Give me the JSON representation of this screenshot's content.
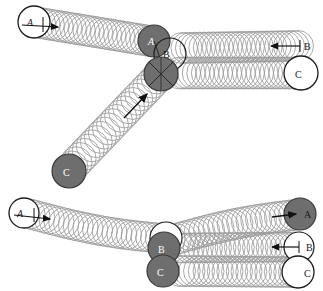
{
  "figure": {
    "type": "strobe-collision-diagram",
    "title": "",
    "panels": [
      {
        "id": "top",
        "name": "panel-top",
        "balls": [
          {
            "label": "A",
            "role": "incoming-cue-ball",
            "state": "start",
            "fill": "white",
            "label_style": "italic",
            "cx": 34,
            "cy": 22,
            "r": 16,
            "arrow": {
              "from": [
                34,
                25
              ],
              "to": [
                60,
                28
              ],
              "direction": "right-down"
            }
          },
          {
            "label": "A",
            "role": "cue-ball",
            "state": "at-impact",
            "fill": "gray",
            "label_style": "italic",
            "cx": 154,
            "cy": 41,
            "r": 16
          },
          {
            "label": "B",
            "role": "target-ball",
            "state": "at-impact",
            "fill": "white",
            "label_style": "upright",
            "cx": 167,
            "cy": 53,
            "r": 16
          },
          {
            "label": "C",
            "role": "third-ball",
            "state": "at-impact",
            "fill": "gray",
            "label_style": "upright",
            "cx": 161,
            "cy": 74,
            "r": 17,
            "crosshair": true
          },
          {
            "label": "C",
            "role": "third-ball",
            "state": "start",
            "fill": "gray",
            "label_style": "upright",
            "cx": 69,
            "cy": 171,
            "r": 17,
            "arrow": {
              "from": [
                122,
                120
              ],
              "to": [
                148,
                93
              ],
              "direction": "up-right"
            }
          },
          {
            "label": "B",
            "role": "target-ball",
            "state": "end",
            "fill": "white",
            "label_style": "upright",
            "cx": 306,
            "cy": 45,
            "r": 16,
            "arrow": {
              "from": [
                300,
                46
              ],
              "to": [
                272,
                46
              ],
              "direction": "left"
            }
          },
          {
            "label": "C",
            "role": "third-ball",
            "state": "end",
            "fill": "white",
            "label_style": "upright",
            "cx": 302,
            "cy": 73,
            "r": 17
          }
        ],
        "trails": [
          {
            "name": "trail-A-incoming",
            "from": [
              34,
              22
            ],
            "to": [
              154,
              41
            ]
          },
          {
            "name": "trail-C-incoming",
            "from": [
              69,
              171
            ],
            "to": [
              161,
              74
            ]
          },
          {
            "name": "trail-B-outgoing",
            "from": [
              180,
              47
            ],
            "to": [
              306,
              45
            ]
          },
          {
            "name": "trail-C-outgoing",
            "from": [
              178,
              73
            ],
            "to": [
              302,
              73
            ]
          }
        ]
      },
      {
        "id": "bottom",
        "name": "panel-bottom",
        "balls": [
          {
            "label": "A",
            "role": "incoming-cue-ball",
            "state": "start",
            "fill": "white",
            "label_style": "italic",
            "cx": 23,
            "cy": 213,
            "r": 15,
            "arrow": {
              "from": [
                23,
                215
              ],
              "to": [
                50,
                217
              ],
              "direction": "right"
            }
          },
          {
            "label": "B",
            "role": "target-ball",
            "state": "at-impact",
            "fill": "gray",
            "label_style": "upright",
            "cx": 164,
            "cy": 247,
            "r": 16
          },
          {
            "label": "C",
            "role": "third-ball",
            "state": "at-impact",
            "fill": "gray",
            "label_style": "upright",
            "cx": 163,
            "cy": 271,
            "r": 16
          },
          {
            "label": "A",
            "role": "cue-ball",
            "state": "end",
            "fill": "gray",
            "label_style": "upright",
            "cx": 299,
            "cy": 214,
            "r": 16,
            "arrow": {
              "from": [
                272,
                216
              ],
              "to": [
                296,
                214
              ],
              "direction": "right"
            }
          },
          {
            "label": "B",
            "role": "target-ball",
            "state": "end",
            "fill": "white",
            "label_style": "upright",
            "cx": 303,
            "cy": 247,
            "r": 15,
            "arrow": {
              "from": [
                300,
                247
              ],
              "to": [
                272,
                247
              ],
              "direction": "left"
            }
          },
          {
            "label": "C",
            "role": "third-ball",
            "state": "end",
            "fill": "white",
            "label_style": "upright",
            "cx": 301,
            "cy": 272,
            "r": 16
          }
        ],
        "trails": [
          {
            "name": "trail-A-bottom-incoming",
            "from": [
              23,
              213
            ],
            "to": [
              175,
              237
            ]
          },
          {
            "name": "trail-A-bottom-outgoing",
            "from": [
              175,
              237
            ],
            "to": [
              299,
              214
            ]
          },
          {
            "name": "trail-B-bottom-outgoing",
            "from": [
              180,
              247
            ],
            "to": [
              303,
              247
            ]
          },
          {
            "name": "trail-C-bottom-outgoing",
            "from": [
              180,
              271
            ],
            "to": [
              301,
              272
            ]
          }
        ]
      }
    ],
    "labels": {
      "ball_a": "A",
      "ball_b": "B",
      "ball_c": "C"
    },
    "colors": {
      "ball_fill_gray": "#6e6e6e",
      "ball_fill_white": "#ffffff",
      "stroke_dark": "#1a1a1a",
      "trail_stroke": "#9a9a9a",
      "background": "#ffffff"
    }
  }
}
